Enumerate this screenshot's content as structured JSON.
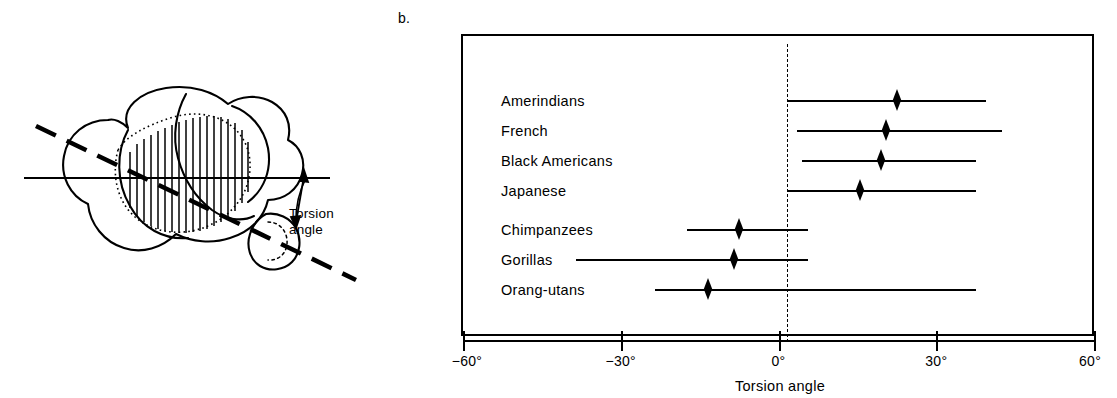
{
  "panel_letter": "b.",
  "anatomy": {
    "caption": "Torsion\nangle",
    "caption_line1": "Torsion",
    "caption_line2": "angle"
  },
  "chart_data": {
    "type": "bar",
    "subtype": "range-with-mean-marker",
    "title": "",
    "xlabel": "Torsion angle",
    "ylabel": "",
    "xlim": [
      -60,
      60
    ],
    "xticks": [
      -60,
      -30,
      0,
      30,
      60
    ],
    "xtick_labels": [
      "−60°",
      "−30°",
      "0°",
      "30°",
      "60°"
    ],
    "grid": false,
    "legend": "none",
    "reference_line": {
      "x": 0,
      "style": "dashed"
    },
    "marker_style": "filled-diamond",
    "categories": [
      "Amerindians",
      "French",
      "Black Americans",
      "Japanese",
      "Chimpanzees",
      "Gorillas",
      "Orang-utans"
    ],
    "series": [
      {
        "name": "range_min",
        "values": [
          0,
          2,
          3,
          0,
          -19,
          -40,
          -25
        ]
      },
      {
        "name": "mean",
        "values": [
          21,
          19,
          18,
          14,
          -9,
          -10,
          -15
        ]
      },
      {
        "name": "range_max",
        "values": [
          38,
          41,
          36,
          36,
          4,
          4,
          36
        ]
      }
    ],
    "rows": [
      {
        "label": "Amerindians",
        "min": 0,
        "mean": 21,
        "max": 38,
        "group": "human"
      },
      {
        "label": "French",
        "min": 2,
        "mean": 19,
        "max": 41,
        "group": "human"
      },
      {
        "label": "Black Americans",
        "min": 3,
        "mean": 18,
        "max": 36,
        "group": "human"
      },
      {
        "label": "Japanese",
        "min": 0,
        "mean": 14,
        "max": 36,
        "group": "human"
      },
      {
        "label": "Chimpanzees",
        "min": -19,
        "mean": -9,
        "max": 4,
        "group": "ape"
      },
      {
        "label": "Gorillas",
        "min": -40,
        "mean": -10,
        "max": 4,
        "group": "ape"
      },
      {
        "label": "Orang-utans",
        "min": -25,
        "mean": -15,
        "max": 36,
        "group": "ape"
      }
    ]
  },
  "colors": {
    "ink": "#000000",
    "background": "#ffffff"
  }
}
